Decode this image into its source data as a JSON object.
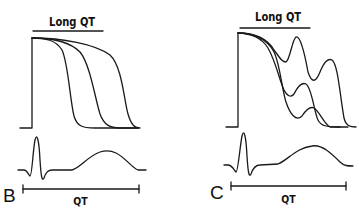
{
  "panels": [
    {
      "label": "B",
      "title": "Long QT",
      "interval_label": "QT",
      "description": "Action potentials with progressively prolonged repolarization (three traces) and surface ECG with long QT interval"
    },
    {
      "label": "C",
      "title": "Long QT",
      "interval_label": "QT",
      "description": "Action potentials with early afterdepolarizations (oscillations during plateau) and surface ECG with long QT interval"
    }
  ],
  "colors": {
    "line": "#1a1a1a",
    "background": "#ffffff"
  }
}
